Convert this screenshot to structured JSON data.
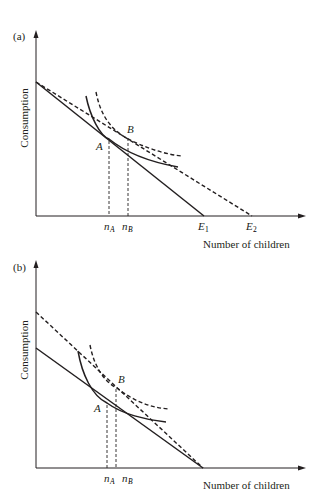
{
  "panels": [
    {
      "id": "a",
      "panel_label": "(a)",
      "y_axis_label": "Consumption",
      "x_axis_label": "Number of children",
      "points": {
        "A": "A",
        "B": "B"
      },
      "x_ticks": {
        "nA": "n",
        "nA_sub": "A",
        "nB": "n",
        "nB_sub": "B",
        "E1": "E",
        "E1_sub": "1",
        "E2": "E",
        "E2_sub": "2"
      },
      "lines": {
        "budget_solid": "original budget line (intercept to E1)",
        "budget_dashed": "new budget line (same intercept, pivots to E2)",
        "indifference_solid": "indifference curve tangent at A",
        "indifference_dashed": "higher indifference curve tangent at B"
      }
    },
    {
      "id": "b",
      "panel_label": "(b)",
      "y_axis_label": "Consumption",
      "x_axis_label": "Number of children",
      "points": {
        "A": "A",
        "B": "B"
      },
      "x_ticks": {
        "nA": "n",
        "nA_sub": "A",
        "nB": "n",
        "nB_sub": "B"
      },
      "lines": {
        "budget_solid": "original budget line",
        "budget_dashed": "new budget line (higher intercept, same x-intercept)",
        "indifference_solid": "indifference curve tangent at A",
        "indifference_dashed": "higher indifference curve tangent at B"
      }
    }
  ]
}
